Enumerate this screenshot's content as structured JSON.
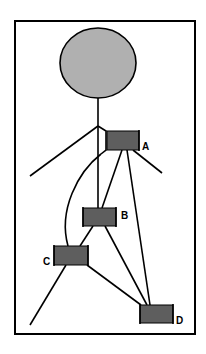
{
  "diagram": {
    "type": "tree-network",
    "frame": {
      "x": 14,
      "y": 20,
      "width": 182,
      "height": 315,
      "stroke": "#000000"
    },
    "root": {
      "shape": "ellipse",
      "cx": 98,
      "cy": 63,
      "rx": 38,
      "ry": 35,
      "fill": "#b0b0b0",
      "stroke": "#000000"
    },
    "colors": {
      "node_fill": "#5e5e5e",
      "root_fill": "#b0b0b0",
      "line": "#000000",
      "background": "#ffffff"
    },
    "nodes": [
      {
        "id": "A",
        "label": "A",
        "x": 107,
        "y": 131,
        "w": 32,
        "h": 19
      },
      {
        "id": "B",
        "label": "B",
        "x": 83,
        "y": 208,
        "w": 33,
        "h": 18
      },
      {
        "id": "C",
        "label": "C",
        "x": 54,
        "y": 246,
        "w": 34,
        "h": 19
      },
      {
        "id": "D",
        "label": "D",
        "x": 140,
        "y": 305,
        "w": 33,
        "h": 18
      }
    ],
    "edges": [
      {
        "from": "root",
        "to": "junction"
      },
      {
        "from": "junction",
        "to": "B"
      },
      {
        "from": "junction",
        "to": "A"
      },
      {
        "from": "junction",
        "to": "left-branch-end"
      },
      {
        "from": "A",
        "to": "B"
      },
      {
        "from": "A",
        "to": "D"
      },
      {
        "from": "A",
        "to": "right-branch-end"
      },
      {
        "from": "A",
        "to": "C",
        "style": "curve"
      },
      {
        "from": "B",
        "to": "C"
      },
      {
        "from": "B",
        "to": "D"
      },
      {
        "from": "C",
        "to": "D"
      },
      {
        "from": "C",
        "to": "bottom-left-end"
      }
    ]
  }
}
